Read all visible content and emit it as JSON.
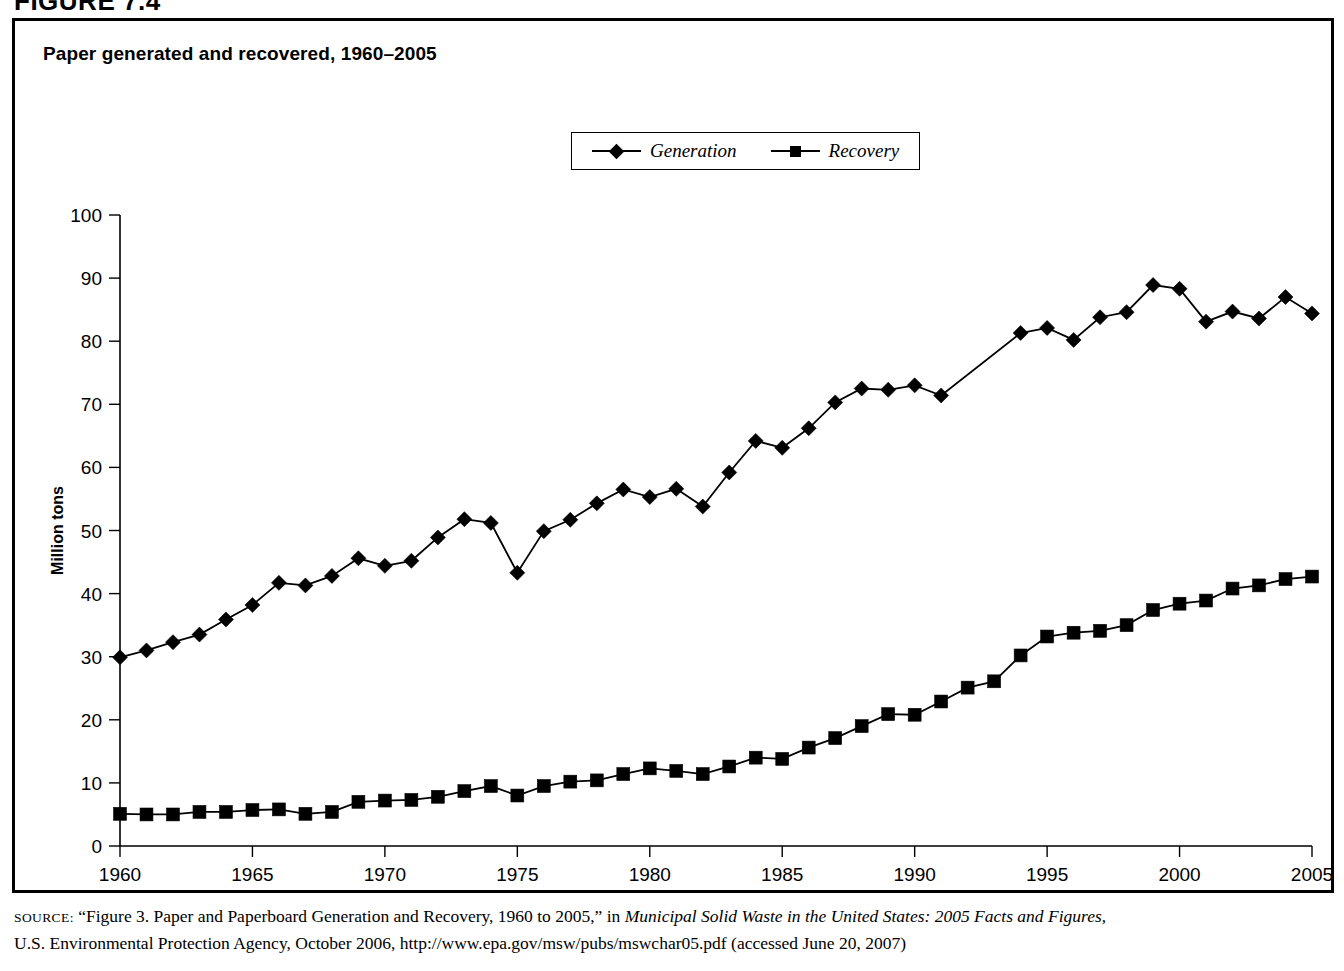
{
  "figure": {
    "number_label": "FIGURE 7.4"
  },
  "chart_title": "Paper generated and recovered, 1960–2005",
  "legend": {
    "position": "top-center",
    "items": [
      {
        "label": "Generation",
        "marker": "diamond-marker",
        "color": "#000000"
      },
      {
        "label": "Recovery",
        "marker": "square-marker",
        "color": "#000000"
      }
    ]
  },
  "axes": {
    "x_label": "Year",
    "y_label": "Million tons",
    "x_ticks": [
      "1960",
      "1965",
      "1970",
      "1975",
      "1980",
      "1985",
      "1990",
      "1995",
      "2000",
      "2005"
    ],
    "y_ticks": [
      "0",
      "10",
      "20",
      "30",
      "40",
      "50",
      "60",
      "70",
      "80",
      "90",
      "100"
    ]
  },
  "source_note": {
    "prefix": "SOURCE:",
    "line1_a": " “Figure 3. Paper and Paperboard Generation and Recovery, 1960 to 2005,” in ",
    "line1_italic": "Municipal Solid Waste in the United States: 2005 Facts and Figures",
    "line1_b": ",",
    "line2": "U.S. Environmental Protection Agency, October 2006, http://www.epa.gov/msw/pubs/mswchar05.pdf (accessed June 20, 2007)"
  },
  "chart_data": {
    "type": "line",
    "title": "Paper generated and recovered, 1960–2005",
    "xlabel": "Year",
    "ylabel": "Million tons",
    "xlim": [
      1960,
      2005
    ],
    "ylim": [
      0,
      100
    ],
    "ytick_step": 10,
    "xtick_step": 5,
    "grid": false,
    "legend_position": "top-center",
    "x": [
      1960,
      1961,
      1962,
      1963,
      1964,
      1965,
      1966,
      1967,
      1968,
      1969,
      1970,
      1971,
      1972,
      1973,
      1974,
      1975,
      1976,
      1977,
      1978,
      1979,
      1980,
      1981,
      1982,
      1983,
      1984,
      1985,
      1986,
      1987,
      1988,
      1989,
      1990,
      1991,
      1992,
      1993,
      1994,
      1995,
      1996,
      1997,
      1998,
      1999,
      2000,
      2001,
      2002,
      2003,
      2004,
      2005
    ],
    "series": [
      {
        "name": "Generation",
        "marker": "diamond",
        "values": [
          29.9,
          31.0,
          32.3,
          33.5,
          35.9,
          38.2,
          41.7,
          41.3,
          42.8,
          45.6,
          44.4,
          45.2,
          48.9,
          51.8,
          51.2,
          43.3,
          49.9,
          51.7,
          54.3,
          56.5,
          55.3,
          56.6,
          53.8,
          59.2,
          64.2,
          63.1,
          66.2,
          70.3,
          72.5,
          72.3,
          73.0,
          71.4,
          null,
          null,
          81.3,
          82.1,
          80.2,
          83.8,
          84.6,
          88.9,
          88.3,
          83.1,
          84.7,
          83.6,
          87.0,
          84.4
        ]
      },
      {
        "name": "Recovery",
        "marker": "square",
        "values": [
          5.1,
          5.0,
          5.0,
          5.4,
          5.4,
          5.7,
          5.8,
          5.1,
          5.4,
          7.0,
          7.2,
          7.3,
          7.8,
          8.7,
          9.5,
          8.0,
          9.5,
          10.2,
          10.4,
          11.4,
          12.3,
          11.9,
          11.4,
          12.6,
          14.0,
          13.8,
          15.6,
          17.1,
          19.0,
          20.9,
          20.8,
          22.9,
          25.1,
          26.1,
          30.2,
          33.2,
          33.8,
          34.1,
          35.0,
          37.4,
          38.4,
          38.9,
          40.8,
          41.3,
          42.3,
          42.7
        ]
      }
    ]
  }
}
